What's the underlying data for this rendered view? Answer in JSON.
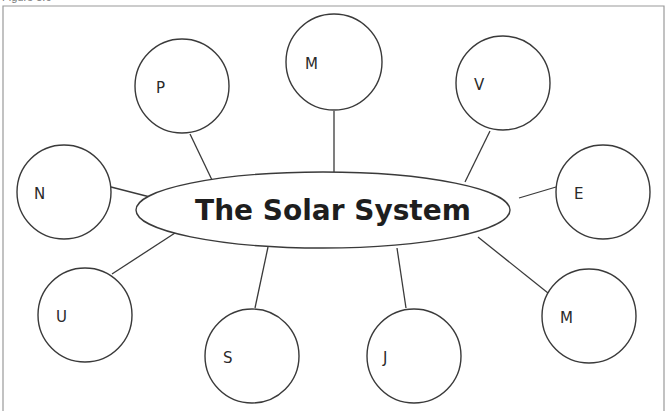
{
  "caption": "Figure 5.6",
  "colors": {
    "stroke": "#3a3a3a",
    "frame": "#9a9a9a",
    "text": "#1e1e1e",
    "background": "#ffffff"
  },
  "center": {
    "title": "The Solar System",
    "cx": 323,
    "cy": 210,
    "rx": 187,
    "ry": 38
  },
  "planets": [
    {
      "letter": "P",
      "cx": 182,
      "cy": 86,
      "r": 47,
      "lx": 156,
      "ly": 93,
      "line": [
        190,
        134,
        212,
        180
      ]
    },
    {
      "letter": "M",
      "cx": 334,
      "cy": 62,
      "r": 48,
      "lx": 305,
      "ly": 69,
      "line": [
        334,
        111,
        334,
        172
      ]
    },
    {
      "letter": "V",
      "cx": 503,
      "cy": 83,
      "r": 47,
      "lx": 474,
      "ly": 90,
      "line": [
        490,
        131,
        465,
        182
      ]
    },
    {
      "letter": "E",
      "cx": 603,
      "cy": 192,
      "r": 47,
      "lx": 574,
      "ly": 199,
      "line": [
        556,
        187,
        519,
        198
      ]
    },
    {
      "letter": "M",
      "cx": 589,
      "cy": 316,
      "r": 47,
      "lx": 560,
      "ly": 323,
      "line": [
        478,
        237,
        548,
        293
      ]
    },
    {
      "letter": "J",
      "cx": 414,
      "cy": 356,
      "r": 47,
      "lx": 383,
      "ly": 363,
      "line": [
        397,
        248,
        406,
        308
      ]
    },
    {
      "letter": "S",
      "cx": 252,
      "cy": 356,
      "r": 47,
      "lx": 223,
      "ly": 363,
      "line": [
        268,
        247,
        255,
        308
      ]
    },
    {
      "letter": "U",
      "cx": 85,
      "cy": 315,
      "r": 47,
      "lx": 56,
      "ly": 322,
      "line": [
        112,
        274,
        175,
        233
      ]
    },
    {
      "letter": "N",
      "cx": 64,
      "cy": 192,
      "r": 47,
      "lx": 34,
      "ly": 199,
      "line": [
        111,
        187,
        150,
        197
      ]
    }
  ],
  "frame": {
    "left": 3,
    "top": 6,
    "right": 664,
    "bottom": 411
  }
}
